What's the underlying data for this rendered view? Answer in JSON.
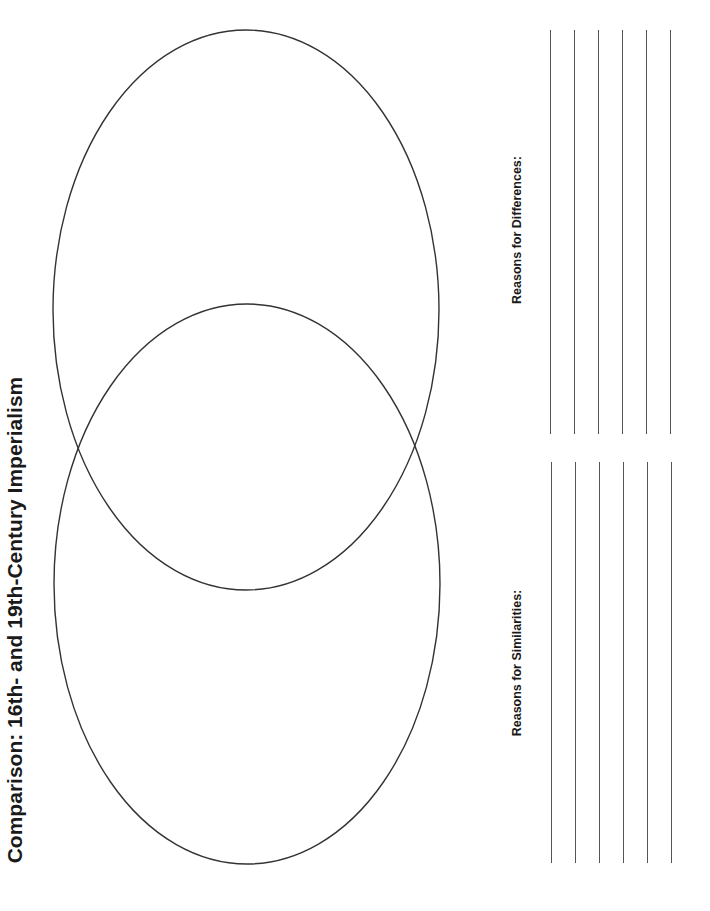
{
  "title": "Comparison: 16th- and 19th-Century Imperialism",
  "venn": {
    "stroke_color": "#333333",
    "circles": [
      {
        "name": "top",
        "cx": 246,
        "cy": 310,
        "rx": 193,
        "ry": 280
      },
      {
        "name": "bottom",
        "cx": 247,
        "cy": 584,
        "rx": 193,
        "ry": 280
      }
    ]
  },
  "sections": {
    "similarities": {
      "label": "Reasons for Similarities:",
      "line_count": 6
    },
    "differences": {
      "label": "Reasons for Differences:",
      "line_count": 6
    }
  }
}
